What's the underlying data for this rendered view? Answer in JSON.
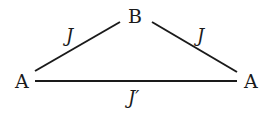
{
  "diagram": {
    "type": "triangle-coupling",
    "nodes": [
      {
        "id": "left",
        "label": "A",
        "x": 22,
        "y": 87
      },
      {
        "id": "top",
        "label": "B",
        "x": 135,
        "y": 24
      },
      {
        "id": "right",
        "label": "A",
        "x": 252,
        "y": 87
      }
    ],
    "edges": [
      {
        "from": "left",
        "to": "top",
        "label": "J"
      },
      {
        "from": "top",
        "to": "right",
        "label": "J"
      },
      {
        "from": "left",
        "to": "right",
        "label": "J′"
      }
    ],
    "colors": {
      "ink": "#1a1a1a",
      "background": "#ffffff"
    }
  }
}
